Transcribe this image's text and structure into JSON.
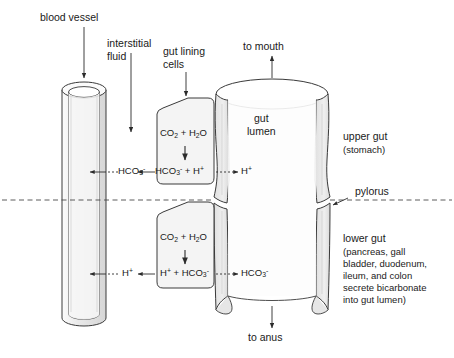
{
  "figure": {
    "type": "biological-schematic"
  },
  "colors": {
    "outline": "#3a3a3a",
    "fill_light": "#f2f2f2",
    "fill_mid": "#e3e3e3",
    "fill_dark": "#d4d4d4",
    "text": "#1a1a1a",
    "background": "#ffffff"
  },
  "labels": {
    "blood_vessel": "blood vessel",
    "interstitial_fluid_line1": "interstitial",
    "interstitial_fluid_line2": "fluid",
    "gut_lining_cells_line1": "gut lining",
    "gut_lining_cells_line2": "cells",
    "to_mouth": "to mouth",
    "to_anus": "to anus",
    "gut_lumen_line1": "gut",
    "gut_lumen_line2": "lumen",
    "upper_gut": "upper gut",
    "upper_gut_detail": "(stomach)",
    "pylorus": "pylorus",
    "lower_gut": "lower gut",
    "lower_gut_detail_line1": "(pancreas, gall",
    "lower_gut_detail_line2": "bladder, duodenum,",
    "lower_gut_detail_line3": "ileum, and colon",
    "lower_gut_detail_line4": "secrete bicarbonate",
    "lower_gut_detail_line5": "into gut lumen)"
  },
  "upper_cell": {
    "reactants": "CO2 + H2O",
    "products": "HCO3- + H+",
    "blood_side_species": "HCO3-",
    "lumen_side_species": "H+"
  },
  "lower_cell": {
    "reactants": "CO2 + H2O",
    "products": "H+ + HCO3-",
    "blood_side_species": "H+",
    "lumen_side_species": "HCO3-"
  },
  "chart_data": {
    "type": "diagram",
    "compartments": [
      "blood vessel",
      "interstitial fluid",
      "gut lining cells",
      "gut lumen"
    ],
    "regions": [
      {
        "name": "upper gut",
        "detail": "stomach",
        "cell_reaction": "CO2 + H2O -> HCO3- + H+",
        "secreted_to_blood": "HCO3-",
        "secreted_to_lumen": "H+"
      },
      {
        "name": "lower gut",
        "detail": "pancreas, gall bladder, duodenum, ileum, and colon secrete bicarbonate into gut lumen",
        "cell_reaction": "CO2 + H2O -> H+ + HCO3-",
        "secreted_to_blood": "H+",
        "secreted_to_lumen": "HCO3-"
      }
    ],
    "boundary": "pylorus",
    "flow_directions": [
      "to mouth",
      "to anus"
    ]
  }
}
